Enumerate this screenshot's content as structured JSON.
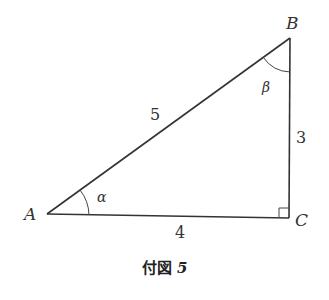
{
  "figure": {
    "caption_prefix": "付図",
    "caption_number": "5",
    "vertices": {
      "A": "A",
      "B": "B",
      "C": "C"
    },
    "sides": {
      "AB": "5",
      "BC": "3",
      "AC": "4"
    },
    "angles": {
      "at_A": "α",
      "at_B": "β"
    },
    "right_angle_at": "C",
    "colors": {
      "stroke": "#333333",
      "background": "#ffffff"
    }
  }
}
